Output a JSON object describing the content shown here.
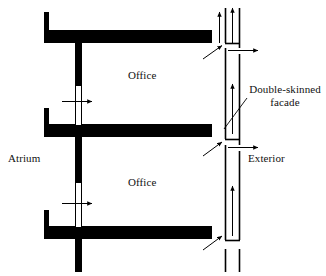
{
  "figure": {
    "type": "architectural-section-diagram",
    "background_color": "#ffffff",
    "ink_color": "#000000"
  },
  "labels": {
    "atrium": "Atrium",
    "office_upper": "Office",
    "office_lower": "Office",
    "exterior": "Exterior",
    "facade_line1": "Double-skinned",
    "facade_line2": "facade"
  },
  "structure": {
    "floor_slabs": [
      {
        "name": "upper-floor-slab",
        "x1": 44,
        "x2": 212,
        "y": 30,
        "thickness": 13
      },
      {
        "name": "middle-floor-slab",
        "x1": 44,
        "x2": 212,
        "y": 124,
        "thickness": 13
      },
      {
        "name": "lower-floor-slab",
        "x1": 44,
        "x2": 212,
        "y": 226,
        "thickness": 13
      }
    ],
    "left_stubs": [
      {
        "name": "upper-left-stub",
        "x": 44,
        "y1": 12,
        "y2": 30,
        "width": 5
      },
      {
        "name": "middle-left-stub",
        "x": 44,
        "y1": 108,
        "y2": 124,
        "width": 5
      },
      {
        "name": "lower-left-stub",
        "x": 44,
        "y1": 210,
        "y2": 226,
        "width": 5
      }
    ],
    "atrium_walls": [
      {
        "name": "upper-atrium-wall",
        "x": 78,
        "y1": 43,
        "y2": 85,
        "width": 7
      },
      {
        "name": "lower-atrium-wall",
        "x": 78,
        "y1": 137,
        "y2": 182,
        "width": 7
      },
      {
        "name": "bottom-atrium-wall",
        "x": 78,
        "y1": 239,
        "y2": 272,
        "width": 7
      }
    ],
    "atrium_openings": [
      {
        "name": "upper-atrium-opening",
        "x": 78,
        "y1": 85,
        "y2": 124,
        "width": 7
      },
      {
        "name": "lower-atrium-opening",
        "x": 78,
        "y1": 182,
        "y2": 226,
        "width": 7
      }
    ],
    "facade_skins": [
      {
        "name": "facade-inner-skin-top",
        "x": 225,
        "y1": 8,
        "y2": 43
      },
      {
        "name": "facade-inner-skin-upper",
        "x": 225,
        "y1": 48,
        "y2": 139
      },
      {
        "name": "facade-inner-skin-lower",
        "x": 225,
        "y1": 145,
        "y2": 240
      },
      {
        "name": "facade-inner-skin-bottom",
        "x": 225,
        "y1": 249,
        "y2": 272
      },
      {
        "name": "facade-outer-skin-upper",
        "x": 239,
        "y1": 8,
        "y2": 48
      },
      {
        "name": "facade-outer-skin-mid",
        "x": 239,
        "y1": 54,
        "y2": 145
      },
      {
        "name": "facade-outer-skin-lower",
        "x": 239,
        "y1": 151,
        "y2": 240
      },
      {
        "name": "facade-outer-skin-bottom",
        "x": 239,
        "y1": 249,
        "y2": 272
      }
    ],
    "facade_connectors": [
      {
        "name": "facade-connector-top",
        "y": 43,
        "x1": 225,
        "x2": 239
      },
      {
        "name": "facade-connector-mid",
        "y": 139,
        "x1": 225,
        "x2": 239
      },
      {
        "name": "facade-connector-bottom",
        "y": 240,
        "x1": 225,
        "x2": 239
      }
    ]
  },
  "airflow": {
    "exhaust_arrows": [
      {
        "name": "exhaust-arrow-inner",
        "x": 225,
        "y_from": 42,
        "y_to": 8
      },
      {
        "name": "exhaust-arrow-outer",
        "x": 233,
        "y_from": 42,
        "y_to": 8
      }
    ],
    "cavity_up_arrows": [
      {
        "name": "cavity-up-arrow-upper",
        "x": 232,
        "y_from": 134,
        "y_to": 84
      },
      {
        "name": "cavity-up-arrow-lower",
        "x": 232,
        "y_from": 236,
        "y_to": 186
      }
    ],
    "outlet_arrows": [
      {
        "name": "outlet-arrow-upper",
        "y": 50,
        "x_from": 228,
        "x_to": 261
      },
      {
        "name": "outlet-arrow-lower",
        "y": 147,
        "x_from": 228,
        "x_to": 261
      }
    ],
    "inlet_arrows": [
      {
        "name": "inlet-arrow-upper",
        "x_from": 202,
        "y_from": 59,
        "x_to": 223,
        "y_to": 45
      },
      {
        "name": "inlet-arrow-mid",
        "x_from": 202,
        "y_from": 156,
        "x_to": 223,
        "y_to": 142
      },
      {
        "name": "inlet-arrow-lower",
        "x_from": 202,
        "y_from": 250,
        "x_to": 223,
        "y_to": 236
      }
    ],
    "atrium_transfer_arrows": [
      {
        "name": "atrium-transfer-arrow-upper",
        "y": 101,
        "x_from": 62,
        "x_to": 95
      },
      {
        "name": "atrium-transfer-arrow-lower",
        "y": 203,
        "x_from": 62,
        "x_to": 95
      }
    ],
    "atrium_shaft_lines": [
      {
        "name": "atrium-shaft-line-left",
        "x": 76,
        "y1": 85,
        "y2": 124
      },
      {
        "name": "atrium-shaft-line-right",
        "x": 82,
        "y1": 85,
        "y2": 124
      },
      {
        "name": "atrium-shaft-line-left-lower",
        "x": 76,
        "y1": 182,
        "y2": 226
      },
      {
        "name": "atrium-shaft-line-right-lower",
        "x": 82,
        "y1": 182,
        "y2": 226
      }
    ]
  },
  "leaders": [
    {
      "name": "facade-leader-line",
      "x_from": 224,
      "y_from": 129,
      "x_to": 247,
      "y_to": 98
    }
  ]
}
